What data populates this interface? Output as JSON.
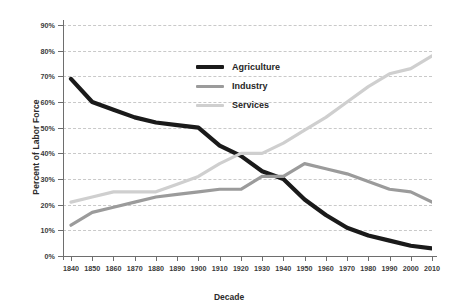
{
  "chart_data": {
    "type": "line",
    "title": "",
    "xlabel": "Decade",
    "ylabel": "Percent of Labor Force",
    "grid": true,
    "legend_position": "top-center",
    "categories": [
      1840,
      1850,
      1860,
      1870,
      1880,
      1890,
      1900,
      1910,
      1920,
      1930,
      1940,
      1950,
      1960,
      1970,
      1980,
      1990,
      2000,
      2010
    ],
    "xlim": [
      1840,
      2010
    ],
    "ylim": [
      0,
      90
    ],
    "ytick_values": [
      0,
      10,
      20,
      30,
      40,
      50,
      60,
      70,
      80,
      90
    ],
    "ytick_labels": [
      "0%",
      "10%",
      "20%",
      "30%",
      "40%",
      "50%",
      "60%",
      "70%",
      "80%",
      "90%"
    ],
    "xtick_labels": [
      "1840",
      "1850",
      "1860",
      "1870",
      "1880",
      "1890",
      "1900",
      "1910",
      "1920",
      "1930",
      "1940",
      "1950",
      "1960",
      "1970",
      "1980",
      "1990",
      "2000",
      "2010"
    ],
    "series": [
      {
        "name": "Agriculture",
        "color": "#1a1a1a",
        "width": 4.2,
        "values": [
          69,
          60,
          57,
          54,
          52,
          51,
          50,
          43,
          39,
          33,
          30,
          22,
          16,
          11,
          8,
          6,
          4,
          3
        ]
      },
      {
        "name": "Industry",
        "color": "#9b9b9b",
        "width": 3.2,
        "values": [
          12,
          17,
          19,
          21,
          23,
          24,
          25,
          26,
          26,
          31,
          31,
          36,
          34,
          32,
          29,
          26,
          25,
          21
        ]
      },
      {
        "name": "Services",
        "color": "#cfcfcf",
        "width": 3.2,
        "values": [
          21,
          23,
          25,
          25,
          25,
          28,
          31,
          36,
          40,
          40,
          44,
          49,
          54,
          60,
          66,
          71,
          73,
          78
        ]
      }
    ]
  },
  "legend": {
    "items": [
      {
        "label": "Agriculture",
        "color": "#1a1a1a",
        "thickness": "4px"
      },
      {
        "label": "Industry",
        "color": "#9b9b9b",
        "thickness": "3px"
      },
      {
        "label": "Services",
        "color": "#cfcfcf",
        "thickness": "3px"
      }
    ]
  }
}
